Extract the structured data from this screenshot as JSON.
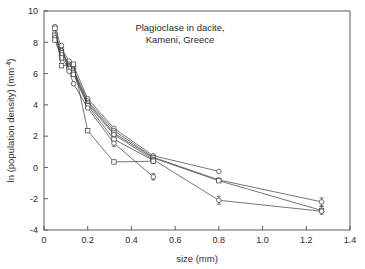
{
  "chart_data": {
    "type": "line",
    "title_line1": "Plagioclase in dacite,",
    "title_line2": "Kameni, Greece",
    "xlabel": "size (mm)",
    "ylabel": "ln (population density) (mm",
    "ylabel_superscript": "-4",
    "ylabel_suffix": ")",
    "xlim": [
      0,
      1.4
    ],
    "ylim": [
      -4,
      10
    ],
    "xticks": [
      0,
      0.2,
      0.4,
      0.6,
      0.8,
      1.0,
      1.2,
      1.4
    ],
    "xticklabels": [
      "0",
      "0.2",
      "0.4",
      "0.6",
      "0.8",
      "1.0",
      "1.2",
      "1.4"
    ],
    "yticks": [
      -4,
      -2,
      0,
      2,
      4,
      6,
      8,
      10
    ],
    "yticklabels": [
      "-4",
      "-2",
      "0",
      "2",
      "4",
      "6",
      "8",
      "10"
    ],
    "grid": false,
    "legend": "none",
    "marker_fill": "#ffffff",
    "line_color": "#3a3a3a",
    "series": [
      {
        "name": "sample-1",
        "marker": "circle",
        "x": [
          0.05,
          0.08,
          0.115,
          0.135,
          0.2,
          0.32,
          0.5,
          0.8
        ],
        "y": [
          9.0,
          7.6,
          6.8,
          6.5,
          4.4,
          2.5,
          0.75,
          -0.25
        ]
      },
      {
        "name": "sample-2",
        "marker": "circle",
        "x": [
          0.05,
          0.08,
          0.115,
          0.135,
          0.2,
          0.32,
          0.5,
          0.8,
          1.27
        ],
        "y": [
          8.6,
          7.45,
          6.6,
          6.25,
          4.25,
          2.35,
          0.65,
          -0.8,
          -2.2
        ]
      },
      {
        "name": "sample-3",
        "marker": "square",
        "x": [
          0.05,
          0.08,
          0.115,
          0.135,
          0.2,
          0.32,
          0.5,
          0.8,
          1.27
        ],
        "y": [
          8.45,
          7.35,
          6.5,
          6.15,
          4.15,
          2.2,
          0.6,
          -0.85,
          -2.75
        ]
      },
      {
        "name": "sample-4",
        "marker": "circle",
        "x": [
          0.05,
          0.08,
          0.115,
          0.135,
          0.2,
          0.32,
          0.5,
          0.8,
          1.27
        ],
        "y": [
          8.3,
          7.2,
          6.4,
          6.05,
          4.05,
          2.1,
          0.5,
          -2.1,
          -2.8
        ]
      },
      {
        "name": "sample-5",
        "marker": "square",
        "x": [
          0.05,
          0.08,
          0.115,
          0.135,
          0.2,
          0.32,
          0.5
        ],
        "y": [
          8.15,
          7.0,
          6.3,
          5.95,
          3.95,
          1.8,
          0.45
        ]
      },
      {
        "name": "sample-6",
        "marker": "circle",
        "x": [
          0.08,
          0.115,
          0.135,
          0.2,
          0.32,
          0.5
        ],
        "y": [
          7.8,
          6.15,
          5.35,
          3.8,
          1.55,
          -0.6
        ]
      },
      {
        "name": "sample-7",
        "marker": "square",
        "x": [
          0.05,
          0.08,
          0.135,
          0.2,
          0.32,
          0.5
        ],
        "y": [
          8.9,
          6.5,
          6.6,
          2.35,
          0.35,
          0.4
        ]
      }
    ],
    "errorbars": [
      {
        "x": 1.27,
        "y": -2.2,
        "lo": -2.45,
        "hi": -1.95
      },
      {
        "x": 1.27,
        "y": -2.75,
        "lo": -3.0,
        "hi": -2.5
      },
      {
        "x": 0.8,
        "y": -2.1,
        "lo": -2.35,
        "hi": -1.85
      },
      {
        "x": 0.5,
        "y": -0.6,
        "lo": -0.8,
        "hi": -0.4
      },
      {
        "x": 0.5,
        "y": 0.45,
        "lo": 0.25,
        "hi": 0.65
      },
      {
        "x": 0.32,
        "y": 1.55,
        "lo": 1.35,
        "hi": 1.75
      }
    ]
  }
}
